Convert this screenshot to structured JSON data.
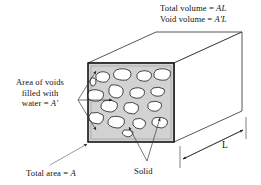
{
  "figure": {
    "labels": {
      "total_volume": "Total volume = ",
      "total_volume_value": "AL",
      "void_volume": "Void volume = ",
      "void_volume_value": "A'L",
      "area_of_voids_line1": "Area of voids",
      "area_of_voids_line2": "filled with",
      "area_of_voids_line3": "water = ",
      "area_of_voids_value": "A'",
      "total_area": "Total area = ",
      "total_area_value": "A",
      "solid": "Solid",
      "length": "L"
    },
    "colors": {
      "solid_fill": "#d2d2d2",
      "void_fill": "#ffffff",
      "outline": "#1a1a1a",
      "leader_line": "#4d4d4d",
      "face_top": "#ffffff",
      "face_side": "#ffffff",
      "background": "#ffffff"
    },
    "geometry": {
      "front_face": {
        "x": 88,
        "y": 63,
        "width": 86,
        "height": 79
      },
      "depth_dx": 68,
      "depth_dy": -31,
      "void_count": 17
    },
    "voids": [
      {
        "cx": 103,
        "cy": 77,
        "rx": 6.5,
        "ry": 5.0,
        "rot": -18
      },
      {
        "cx": 123,
        "cy": 74,
        "rx": 8.0,
        "ry": 5.5,
        "rot": 12
      },
      {
        "cx": 145,
        "cy": 76,
        "rx": 7.0,
        "ry": 5.0,
        "rot": -8
      },
      {
        "cx": 163,
        "cy": 75,
        "rx": 8.0,
        "ry": 5.5,
        "rot": 15
      },
      {
        "cx": 96,
        "cy": 96,
        "rx": 8.0,
        "ry": 5.5,
        "rot": 8
      },
      {
        "cx": 117,
        "cy": 91,
        "rx": 7.0,
        "ry": 6.0,
        "rot": -22
      },
      {
        "cx": 138,
        "cy": 93,
        "rx": 6.5,
        "ry": 5.0,
        "rot": 18
      },
      {
        "cx": 158,
        "cy": 92,
        "rx": 6.0,
        "ry": 4.5,
        "rot": -10
      },
      {
        "cx": 110,
        "cy": 106,
        "rx": 7.5,
        "ry": 5.0,
        "rot": 22
      },
      {
        "cx": 132,
        "cy": 108,
        "rx": 6.5,
        "ry": 5.5,
        "rot": -14
      },
      {
        "cx": 155,
        "cy": 107,
        "rx": 6.0,
        "ry": 4.5,
        "rot": 10
      },
      {
        "cx": 97,
        "cy": 118,
        "rx": 6.5,
        "ry": 5.5,
        "rot": -20
      },
      {
        "cx": 117,
        "cy": 122,
        "rx": 7.5,
        "ry": 5.5,
        "rot": 16
      },
      {
        "cx": 140,
        "cy": 124,
        "rx": 6.0,
        "ry": 5.0,
        "rot": -6
      },
      {
        "cx": 160,
        "cy": 123,
        "rx": 7.5,
        "ry": 5.5,
        "rot": 14
      },
      {
        "cx": 93,
        "cy": 82,
        "rx": 2.5,
        "ry": 4.5,
        "rot": 0
      },
      {
        "cx": 128,
        "cy": 133,
        "rx": 5.0,
        "ry": 4.0,
        "rot": 0
      }
    ],
    "leaders": {
      "voids_fan_origin": {
        "x": 78,
        "y": 100
      },
      "voids_targets": [
        {
          "x": 95,
          "y": 70
        },
        {
          "x": 113,
          "y": 100
        },
        {
          "x": 95,
          "y": 131
        }
      ],
      "total_area_from": {
        "x": 52,
        "y": 164
      },
      "total_area_to": {
        "x": 86,
        "y": 144
      },
      "solid_fan_origin": {
        "x": 147,
        "y": 161
      },
      "solid_targets": [
        {
          "x": 129,
          "y": 128
        },
        {
          "x": 160,
          "y": 119
        }
      ]
    },
    "dimension": {
      "label": "L",
      "start": {
        "x": 183,
        "y": 157
      },
      "end": {
        "x": 242,
        "y": 129
      }
    }
  }
}
